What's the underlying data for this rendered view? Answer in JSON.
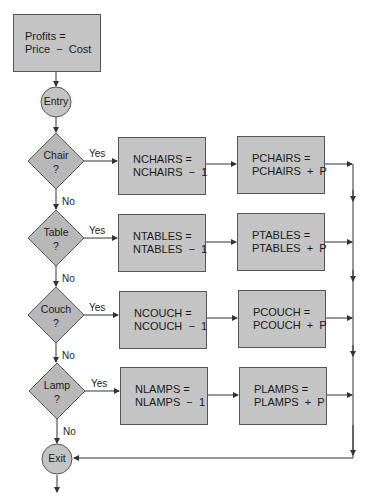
{
  "diagram": {
    "start_box": {
      "line1": "Profits =",
      "line2": "Price  −  Cost"
    },
    "entry": "Entry",
    "exit": "Exit",
    "yes_label": "Yes",
    "no_label": "No",
    "decisions": [
      {
        "question": "Chair",
        "mark": "?",
        "count_line1": "NCHAIRS =",
        "count_line2": "NCHAIRS  −  1",
        "profit_line1": "PCHAIRS =",
        "profit_line2": "PCHAIRS  +  P"
      },
      {
        "question": "Table",
        "mark": "?",
        "count_line1": "NTABLES =",
        "count_line2": "NTABLES  −  1",
        "profit_line1": "PTABLES =",
        "profit_line2": "PTABLES  +  P"
      },
      {
        "question": "Couch",
        "mark": "?",
        "count_line1": "NCOUCH =",
        "count_line2": "NCOUCH  −  1",
        "profit_line1": "PCOUCH =",
        "profit_line2": "PCOUCH  +  P"
      },
      {
        "question": "Lamp",
        "mark": "?",
        "count_line1": "NLAMPS =",
        "count_line2": "NLAMPS  −  1",
        "profit_line1": "PLAMPS =",
        "profit_line2": "PLAMPS  +  P"
      }
    ],
    "colors": {
      "fill": "#c4c4c4",
      "stroke": "#555555",
      "line": "#333333"
    }
  }
}
